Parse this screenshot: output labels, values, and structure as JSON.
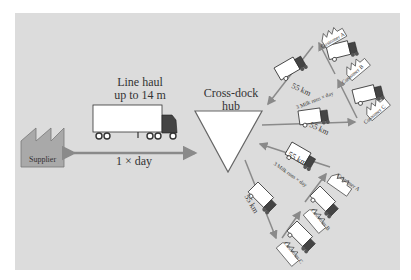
{
  "diagram": {
    "type": "cross-dock logistics network",
    "supplier": {
      "label": "Supplier"
    },
    "line_haul": {
      "title_line1": "Line haul",
      "title_line2": "up to 14 m",
      "frequency": "1 × day"
    },
    "hub": {
      "label_line1": "Cross-dock",
      "label_line2": "hub"
    },
    "milk_run_top": {
      "frequency": "3 Milk runs × day",
      "distance_out": "55 km",
      "distance_in": "55 km",
      "customers": [
        "Customer A",
        "Customer B",
        "Customer C"
      ]
    },
    "milk_run_bottom": {
      "frequency": "3 Milk runs × day",
      "distance_out": "55 km",
      "distance_in": "55 km",
      "customers": [
        "Customer A",
        "Customer B",
        "Customer C"
      ]
    },
    "colors": {
      "background": "#dcdcdc",
      "arrow": "#8a8a8a",
      "supplier_fill": "#a9a9a9",
      "truck_body": "#ffffff",
      "outline": "#333333"
    }
  }
}
